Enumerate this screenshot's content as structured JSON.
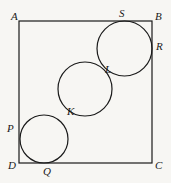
{
  "figure": {
    "type": "geometry-diagram",
    "background_color": "#f7f6f3",
    "stroke_color": "#1a1a1a",
    "label_color": "#1a1a1a"
  },
  "square": {
    "name": "ABCD",
    "x": 19,
    "y": 21,
    "width": 133,
    "height": 142,
    "stroke_width": 1.2,
    "vertices": [
      {
        "id": "A",
        "corner": "top-left",
        "x": 19,
        "y": 21
      },
      {
        "id": "B",
        "corner": "top-right",
        "x": 152,
        "y": 21
      },
      {
        "id": "C",
        "corner": "bottom-right",
        "x": 152,
        "y": 163
      },
      {
        "id": "D",
        "corner": "bottom-left",
        "x": 19,
        "y": 163
      }
    ]
  },
  "circles": [
    {
      "id": "circle-bottom-left",
      "cx": 44,
      "cy": 139,
      "r": 24,
      "tangent_points": [
        "P",
        "Q",
        "K"
      ],
      "stroke_width": 1.2
    },
    {
      "id": "circle-middle",
      "cx": 85,
      "cy": 89,
      "r": 27,
      "tangent_points": [
        "K",
        "L"
      ],
      "stroke_width": 1.2
    },
    {
      "id": "circle-top-right",
      "cx": 124.5,
      "cy": 48.5,
      "r": 27.5,
      "tangent_points": [
        "S",
        "R",
        "L"
      ],
      "stroke_width": 1.2
    }
  ],
  "labels": [
    {
      "id": "A",
      "text": "A",
      "x": 11,
      "y": 11
    },
    {
      "id": "B",
      "text": "B",
      "x": 155,
      "y": 11
    },
    {
      "id": "S",
      "text": "S",
      "x": 119,
      "y": 8
    },
    {
      "id": "R",
      "text": "R",
      "x": 156,
      "y": 41
    },
    {
      "id": "L",
      "text": "L",
      "x": 105,
      "y": 64
    },
    {
      "id": "K",
      "text": "K",
      "x": 67,
      "y": 106
    },
    {
      "id": "P",
      "text": "P",
      "x": 7,
      "y": 123
    },
    {
      "id": "D",
      "text": "D",
      "x": 8,
      "y": 160
    },
    {
      "id": "Q",
      "text": "Q",
      "x": 43,
      "y": 166
    },
    {
      "id": "C",
      "text": "C",
      "x": 155,
      "y": 160
    }
  ]
}
